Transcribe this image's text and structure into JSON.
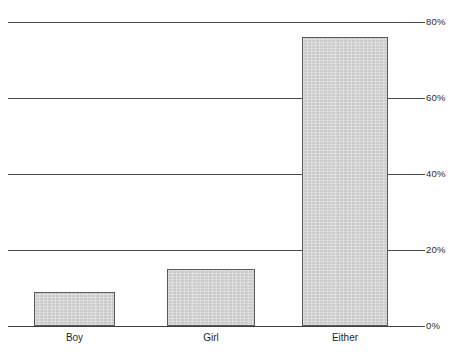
{
  "chart_data": {
    "type": "bar",
    "title": "",
    "subtitle": "",
    "xlabel": "",
    "ylabel": "",
    "categories": [
      "Boy",
      "Girl",
      "Either"
    ],
    "values": [
      9,
      15,
      76
    ],
    "value_unit": "%",
    "ylim": [
      0,
      80
    ],
    "yticks": [
      0,
      20,
      40,
      60,
      80
    ],
    "ytick_labels": [
      "0%",
      "20%",
      "40%",
      "60%",
      "80%"
    ],
    "grid": "horizontal",
    "legend": "none",
    "series": [
      {
        "name": "Preference",
        "values": [
          9,
          15,
          76
        ]
      }
    ],
    "colors": {
      "bar_fill": "#cdcdcd",
      "bar_border": "#5a5a5a",
      "gridline": "#4c4c4c",
      "axis": "#3f3f3f",
      "text": "#1f1f1f",
      "background": "#ffffff"
    }
  },
  "axis": {
    "y_ticks": [
      {
        "label": "80%",
        "value": 80
      },
      {
        "label": "60%",
        "value": 60
      },
      {
        "label": "40%",
        "value": 40
      },
      {
        "label": "20%",
        "value": 20
      },
      {
        "label": "0%",
        "value": 0
      }
    ],
    "x_categories": [
      {
        "label": "Boy"
      },
      {
        "label": "Girl"
      },
      {
        "label": "Either"
      }
    ]
  }
}
